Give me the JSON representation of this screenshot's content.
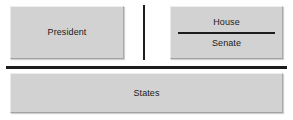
{
  "diagram": {
    "background_color": "#ffffff",
    "box_fill_color": "#d2d2d2",
    "rule_color": "#1c1c1c",
    "text_color": "#1a1a1a",
    "federal_branches": {
      "executive": {
        "label": "President"
      },
      "legislative": {
        "upper_chamber_label": "House",
        "lower_chamber_label": "Senate"
      }
    },
    "subnational": {
      "label": "States"
    },
    "dividers": {
      "branch_divider_name": "vertical-rule",
      "chamber_divider_name": "horizontal-rule",
      "federal_state_divider_name": "thick-horizontal-rule"
    }
  }
}
